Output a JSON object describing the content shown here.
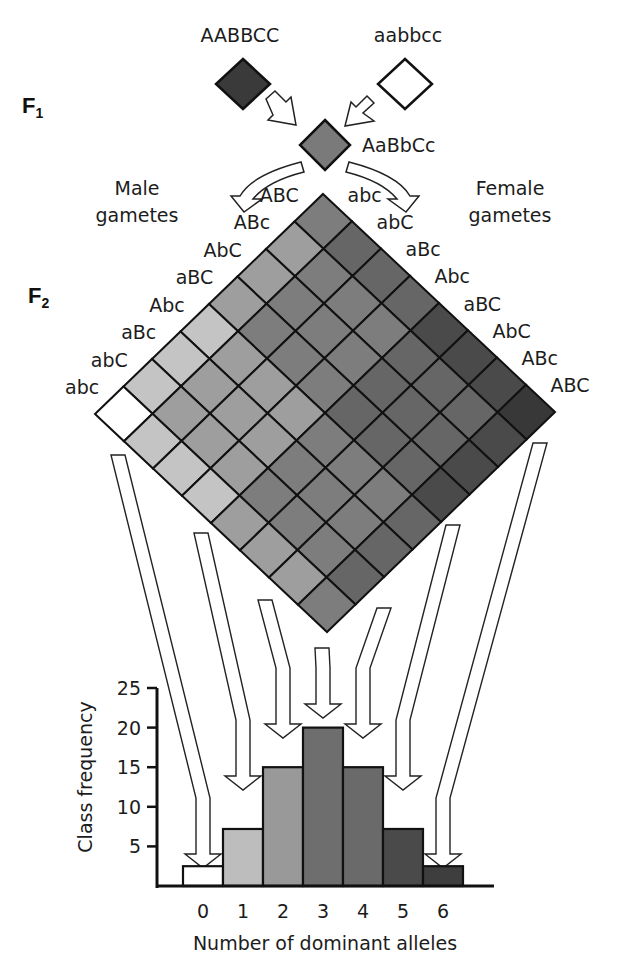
{
  "figure": {
    "generations": {
      "f1": "F",
      "f1_sub": "1",
      "f2": "F",
      "f2_sub": "2"
    },
    "parents": {
      "dominant": "AABBCC",
      "recessive": "aabbcc"
    },
    "f1_genotype": "AaBbCc",
    "male_gametes_label": [
      "Male",
      "gametes"
    ],
    "female_gametes_label": [
      "Female",
      "gametes"
    ],
    "male_gametes": [
      "ABC",
      "ABc",
      "AbC",
      "aBC",
      "Abc",
      "aBc",
      "abC",
      "abc"
    ],
    "female_gametes": [
      "abc",
      "abC",
      "aBc",
      "Abc",
      "aBC",
      "AbC",
      "ABc",
      "ABC"
    ],
    "shade_by_dominant_count": [
      "#ffffff",
      "#c4c4c4",
      "#9e9e9e",
      "#7d7d7d",
      "#666666",
      "#4a4a4a",
      "#383838"
    ],
    "parent_colors": {
      "dominant": "#3a3a3a",
      "recessive": "#ffffff",
      "f1": "#7a7a7a"
    }
  },
  "chart_data": {
    "type": "bar",
    "title": "",
    "xlabel": "Number of dominant alleles",
    "ylabel": "Class frequency",
    "categories": [
      "0",
      "1",
      "2",
      "3",
      "4",
      "5",
      "6"
    ],
    "values": [
      2.5,
      7.2,
      15,
      20,
      15,
      7.2,
      2.5
    ],
    "ylim": [
      0,
      25
    ],
    "yticks": [
      5,
      10,
      15,
      20,
      25
    ],
    "grid": false,
    "bar_colors": [
      "#ffffff",
      "#bdbdbd",
      "#999999",
      "#6e6e6e",
      "#6a6a6a",
      "#4a4a4a",
      "#3e3e3e"
    ]
  }
}
